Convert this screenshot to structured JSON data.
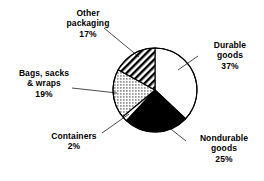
{
  "chart_data": {
    "type": "pie",
    "title": "",
    "subtitle": "",
    "xlabel": "",
    "ylabel": "",
    "legend_position": "none",
    "grid": false,
    "labels_with_leader_lines": true,
    "units": "percent",
    "categories": [
      "Durable goods",
      "Nondurable goods",
      "Containers",
      "Bags, sacks & wraps",
      "Other packaging"
    ],
    "values": [
      37,
      25,
      2,
      19,
      17
    ],
    "slices": [
      {
        "name": "Durable goods",
        "value": 37,
        "value_label": "37%",
        "label_lines": [
          "Durable",
          "goods",
          "37%"
        ],
        "fill": "white",
        "fill_color": "#ffffff",
        "start_angle_deg": 0,
        "sweep_deg": 133.2
      },
      {
        "name": "Nondurable goods",
        "value": 25,
        "value_label": "25%",
        "label_lines": [
          "Nondurable",
          "goods",
          "25%"
        ],
        "fill": "solid-black",
        "fill_color": "#000000",
        "start_angle_deg": 133.2,
        "sweep_deg": 90
      },
      {
        "name": "Containers",
        "value": 2,
        "value_label": "2%",
        "label_lines": [
          "Containers",
          "2%"
        ],
        "fill": "white",
        "fill_color": "#ffffff",
        "start_angle_deg": 223.2,
        "sweep_deg": 7.2
      },
      {
        "name": "Bags, sacks & wraps",
        "value": 19,
        "value_label": "19%",
        "label_lines": [
          "Bags, sacks",
          "& wraps",
          "19%"
        ],
        "fill": "dotted",
        "fill_color": "#ffffff",
        "start_angle_deg": 230.4,
        "sweep_deg": 68.4
      },
      {
        "name": "Other packaging",
        "value": 17,
        "value_label": "17%",
        "label_lines": [
          "Other",
          "packaging",
          "17%"
        ],
        "fill": "diagonal-hatch",
        "fill_color": "#ffffff",
        "start_angle_deg": 298.8,
        "sweep_deg": 61.2
      }
    ],
    "stroke_color": "#000000",
    "geometry": {
      "cx": 155,
      "cy": 90,
      "r": 42
    }
  },
  "labels": {
    "other_packaging": {
      "line1": "Other",
      "line2": "packaging",
      "line3": "17%"
    },
    "durable_goods": {
      "line1": "Durable",
      "line2": "goods",
      "line3": "37%"
    },
    "bags_sacks_wraps": {
      "line1": "Bags, sacks",
      "line2": "& wraps",
      "line3": "19%"
    },
    "containers": {
      "line1": "Containers",
      "line2": "2%"
    },
    "nondurable_goods": {
      "line1": "Nondurable",
      "line2": "goods",
      "line3": "25%"
    }
  }
}
